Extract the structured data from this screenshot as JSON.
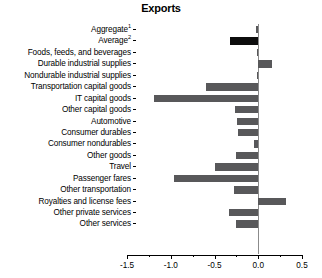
{
  "chart": {
    "title": "Exports",
    "type": "bar",
    "orientation": "horizontal",
    "xlabel": "",
    "ylabel": "",
    "grid": false,
    "legend": "none",
    "accent_color": "#0d0d0d",
    "bar_color": "#58585a",
    "zero_line_color": "#8b8b8b"
  },
  "chart_data": {
    "type": "bar",
    "title": "Exports",
    "orientation": "horizontal",
    "xlabel": "",
    "ylabel": "",
    "xlim": [
      -1.5,
      0.5
    ],
    "xticks": [
      -1.5,
      -1.0,
      -0.5,
      0.0,
      0.5
    ],
    "xticklabels": [
      "-1.5",
      "-1.0",
      "-0.5",
      "0.0",
      "0.5"
    ],
    "minor_xticks": [
      -1.25,
      -0.75,
      -0.25,
      0.25
    ],
    "grid": false,
    "legend": "none",
    "categories": [
      "Aggregate1",
      "Average2",
      "Foods, feeds, and beverages",
      "Durable industrial supplies",
      "Nondurable industrial supplies",
      "Transportation capital goods",
      "IT capital goods",
      "Other capital goods",
      "Automotive",
      "Consumer durables",
      "Consumer nondurables",
      "Other goods",
      "Travel",
      "Passenger fares",
      "Other transportation",
      "Royalties and license fees",
      "Other private services",
      "Other services"
    ],
    "values": [
      -0.03,
      -0.32,
      -0.02,
      0.16,
      -0.02,
      -0.6,
      -1.19,
      -0.27,
      -0.24,
      -0.23,
      -0.05,
      -0.26,
      -0.49,
      -0.96,
      -0.28,
      0.32,
      -0.33,
      -0.25
    ],
    "highlight_index": 1
  },
  "rows": [
    {
      "label": "Aggregate",
      "sup": "1",
      "value": -0.03,
      "accent": false
    },
    {
      "label": "Average",
      "sup": "2",
      "value": -0.32,
      "accent": true
    },
    {
      "label": "Foods, feeds, and beverages",
      "sup": "",
      "value": -0.02,
      "accent": false
    },
    {
      "label": "Durable industrial supplies",
      "sup": "",
      "value": 0.16,
      "accent": false
    },
    {
      "label": "Nondurable industrial supplies",
      "sup": "",
      "value": -0.02,
      "accent": false
    },
    {
      "label": "Transportation capital goods",
      "sup": "",
      "value": -0.6,
      "accent": false
    },
    {
      "label": "IT capital goods",
      "sup": "",
      "value": -1.19,
      "accent": false
    },
    {
      "label": "Other capital goods",
      "sup": "",
      "value": -0.27,
      "accent": false
    },
    {
      "label": "Automotive",
      "sup": "",
      "value": -0.24,
      "accent": false
    },
    {
      "label": "Consumer durables",
      "sup": "",
      "value": -0.23,
      "accent": false
    },
    {
      "label": "Consumer nondurables",
      "sup": "",
      "value": -0.05,
      "accent": false
    },
    {
      "label": "Other goods",
      "sup": "",
      "value": -0.26,
      "accent": false
    },
    {
      "label": "Travel",
      "sup": "",
      "value": -0.49,
      "accent": false
    },
    {
      "label": "Passenger fares",
      "sup": "",
      "value": -0.96,
      "accent": false
    },
    {
      "label": "Other transportation",
      "sup": "",
      "value": -0.28,
      "accent": false
    },
    {
      "label": "Royalties and license fees",
      "sup": "",
      "value": 0.32,
      "accent": false
    },
    {
      "label": "Other private services",
      "sup": "",
      "value": -0.33,
      "accent": false
    },
    {
      "label": "Other services",
      "sup": "",
      "value": -0.25,
      "accent": false
    }
  ],
  "axis": {
    "ticks": [
      {
        "value": -1.5,
        "label": "-1.5",
        "major": true
      },
      {
        "value": -1.25,
        "label": "",
        "major": false
      },
      {
        "value": -1.0,
        "label": "-1.0",
        "major": true
      },
      {
        "value": -0.75,
        "label": "",
        "major": false
      },
      {
        "value": -0.5,
        "label": "-0.5",
        "major": true
      },
      {
        "value": -0.25,
        "label": "",
        "major": false
      },
      {
        "value": 0.0,
        "label": "0.0",
        "major": true
      },
      {
        "value": 0.25,
        "label": "",
        "major": false
      },
      {
        "value": 0.5,
        "label": "0.5",
        "major": true
      }
    ]
  }
}
